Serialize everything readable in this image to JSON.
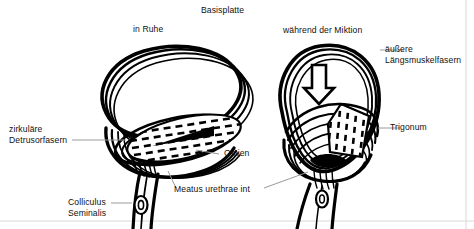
{
  "figure": {
    "width": 474,
    "height": 229,
    "background_color": "#ffffff",
    "ink_color": "#000000",
    "leader_color": "#9a9a9a"
  },
  "labels": {
    "basisplatte": "Basisplatte",
    "in_ruhe": "in Ruhe",
    "waehrend_der_miktion": "während der Miktion",
    "aeussere": "äußere",
    "laengsmuskelfasern": "Längsmuskelfasern",
    "trigonum": "Trigonum",
    "zirkulaere": "zirkuläre",
    "detrusorfasern": "Detrusorfasern",
    "ostien": "Ostien",
    "meatus_urethrae_int": "Meatus urethrae int",
    "colliculus": "Colliculus",
    "seminalis": "Seminalis"
  },
  "panels": [
    {
      "id": "left",
      "caption": "in Ruhe",
      "description": "Harnblase in Ruhe, flache ovale Form mit geschlossenem Blasenhals"
    },
    {
      "id": "right",
      "caption": "während der Miktion",
      "description": "Harnblase während der Miktion, birnenförmig mit trichterförmig geöffnetem Blasenhals"
    }
  ],
  "annotations": {
    "arrow": {
      "name": "downward-arrow",
      "panel": "right",
      "direction": "down",
      "style": "hollow-outline"
    },
    "hatched_regions": [
      {
        "name": "trigone-left",
        "panel": "left",
        "pattern": "dashed-hatch"
      },
      {
        "name": "trigone-right",
        "panel": "right",
        "pattern": "dashed-hatch"
      }
    ]
  }
}
